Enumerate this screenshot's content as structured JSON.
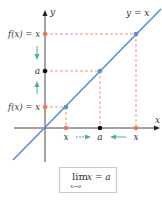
{
  "diagram": {
    "axis_x_label": "x",
    "axis_y_label": "y",
    "line_label": "y = x",
    "y_axis_labels": {
      "top": "f(x) = x",
      "middle": "a",
      "bottom": "f(x) = x"
    },
    "x_axis_labels": {
      "left": "x",
      "middle": "a",
      "right": "x"
    },
    "colors": {
      "line": "#5b8fc9",
      "point_orange": "#e8785a",
      "point_black": "#111111",
      "arrow_green": "#4fb08a",
      "dashed": "#e8785a",
      "axis": "#333333"
    }
  },
  "formula": {
    "lim": "lim",
    "subscript": "x→a",
    "expression": "x = a"
  }
}
